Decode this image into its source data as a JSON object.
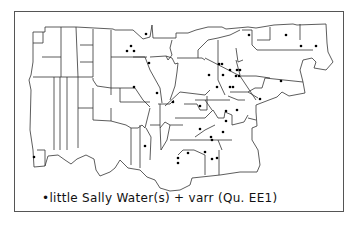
{
  "map": {
    "title_legend": "•little Sally Water(s) + varr (Qu. EE1)",
    "legend_symbol": "dot",
    "legend_text": "little Sally Water(s) + varr",
    "legend_question": "(Qu. EE1)",
    "colors": {
      "line": "#333333",
      "dot": "#000000",
      "background": "#ffffff"
    },
    "dot_count_approx": 38
  }
}
